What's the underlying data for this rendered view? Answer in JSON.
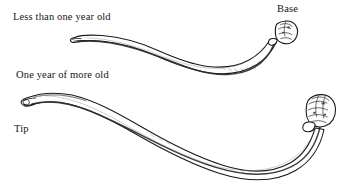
{
  "figure": {
    "type": "scientific-line-drawing",
    "background_color": "#ffffff",
    "ink_color": "#1b1b1b",
    "labels": {
      "upper_specimen": "Less than one year old",
      "lower_specimen": "One year of more old",
      "base": "Base",
      "tip": "Tip"
    },
    "specimens": [
      {
        "name": "upper-specimen",
        "age_label": "Less than one year old",
        "orientation": "tip at left, base at right",
        "end_features": [
          "tapered tip",
          "bulbous knobbed base"
        ]
      },
      {
        "name": "lower-specimen",
        "age_label": "One year of more old",
        "orientation": "tip at left, base at right",
        "end_features": [
          "rounded blunt tip",
          "bulbous knobbed base"
        ]
      }
    ]
  }
}
